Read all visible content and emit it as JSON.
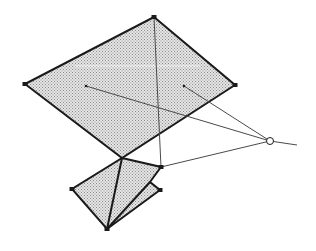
{
  "diagram": {
    "width": 316,
    "height": 251,
    "colors": {
      "stroke": "#1a1a1a",
      "thin_stroke": "#4a4a4a",
      "fill_base": "#e6e6e6",
      "fill_dot": "#8a8a8a",
      "background": "#ffffff"
    },
    "large_quad": {
      "points": [
        [
          154,
          17
        ],
        [
          235,
          85
        ],
        [
          122,
          158
        ],
        [
          25,
          84
        ]
      ],
      "vertex_markers": [
        [
          154,
          17
        ],
        [
          235,
          85
        ],
        [
          25,
          84
        ]
      ]
    },
    "small_shape": {
      "outer_points": [
        [
          122,
          158
        ],
        [
          161,
          167
        ],
        [
          150,
          182
        ],
        [
          160,
          190
        ],
        [
          107,
          229
        ],
        [
          72,
          189
        ]
      ],
      "inner_lines": [
        [
          [
            107,
            229
          ],
          [
            122,
            158
          ]
        ],
        [
          [
            107,
            229
          ],
          [
            150,
            182
          ]
        ]
      ],
      "vertex_markers": [
        [
          161,
          167
        ],
        [
          160,
          190
        ],
        [
          72,
          189
        ],
        [
          107,
          229
        ]
      ]
    },
    "interior_dots": [
      [
        86,
        86
      ],
      [
        184,
        86
      ]
    ],
    "vanishing_point": {
      "center": [
        270,
        141
      ],
      "radius": 3.5
    },
    "projection_lines": [
      [
        [
          86,
          86
        ],
        [
          270,
          141
        ]
      ],
      [
        [
          184,
          86
        ],
        [
          270,
          141
        ]
      ],
      [
        [
          161,
          167
        ],
        [
          270,
          141
        ]
      ],
      [
        [
          154,
          17
        ],
        [
          161,
          167
        ]
      ],
      [
        [
          270,
          141
        ],
        [
          297,
          145
        ]
      ]
    ]
  }
}
